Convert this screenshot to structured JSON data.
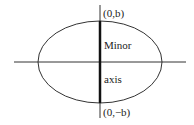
{
  "diagram": {
    "labels": {
      "top_point": "(0,b)",
      "bottom_point": "(0,−b)",
      "minor_line1": "Minor",
      "minor_line2": "axis"
    },
    "colors": {
      "stroke": "#222222",
      "background": "#ffffff"
    }
  }
}
